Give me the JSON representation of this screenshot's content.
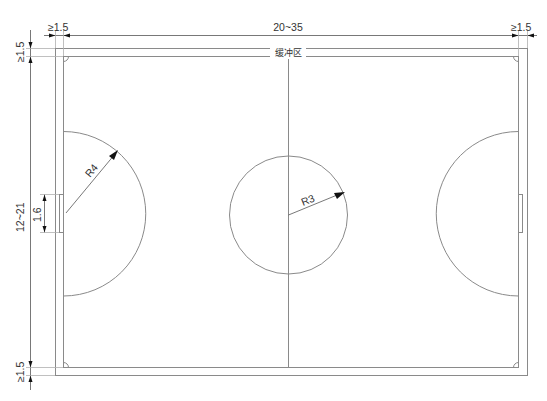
{
  "diagram": {
    "type": "futsal-pitch-dimension-drawing",
    "dimensions": {
      "top_left_margin": "≥1.5",
      "length": "20~35",
      "top_right_margin": "≥1.5",
      "left_top_margin": "≥1.5",
      "width": "12~21",
      "goal_width": "1.6",
      "left_bottom_margin": "≥1.5"
    },
    "labels": {
      "buffer_zone": "缓冲区",
      "penalty_radius": "R4",
      "center_circle_radius": "R3"
    }
  }
}
